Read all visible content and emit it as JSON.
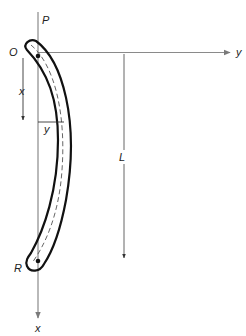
{
  "diagram": {
    "labels": {
      "load": "P",
      "origin": "O",
      "y_axis": "y",
      "x_axis_bottom": "x",
      "x_dimension": "x",
      "y_dimension": "y",
      "length": "L",
      "end_point": "R"
    },
    "colors": {
      "axis": "#8a8a8a",
      "column_outline": "#111111",
      "centerline": "#555555",
      "text": "#222222"
    }
  }
}
